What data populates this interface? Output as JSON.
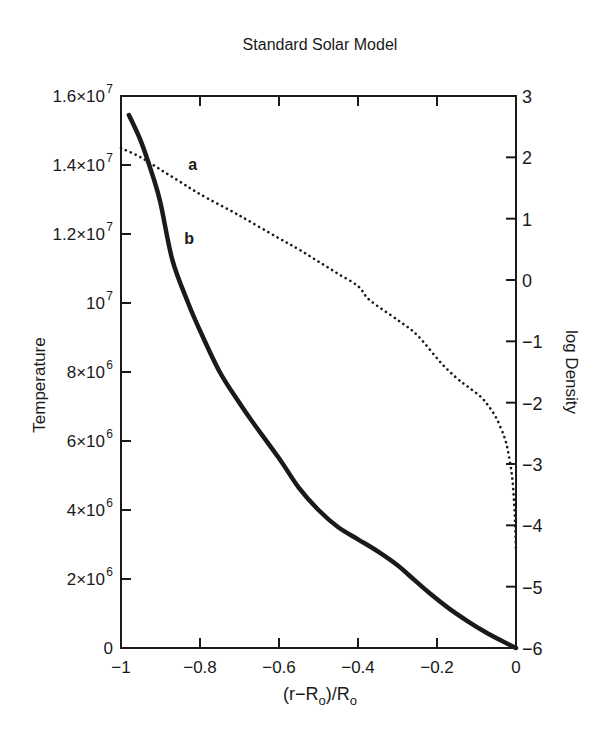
{
  "chart_data": {
    "type": "line",
    "title": "Standard Solar Model",
    "xlabel": "(r−R_o)/R_o",
    "xlabel_parts": {
      "open": "(r−R",
      "sub1": "o",
      "mid": ")/R",
      "sub2": "o"
    },
    "ylabel_left": "Temperature",
    "ylabel_right": "log Density",
    "xlim": [
      -1,
      0
    ],
    "ylim_left": [
      0,
      16000000
    ],
    "ylim_right": [
      -6,
      3
    ],
    "grid": false,
    "legend": "inline labels a and b",
    "x_ticks": [
      {
        "value": -1,
        "label": "−1"
      },
      {
        "value": -0.8,
        "label": "−0.8"
      },
      {
        "value": -0.6,
        "label": "−0.6"
      },
      {
        "value": -0.4,
        "label": "−0.4"
      },
      {
        "value": -0.2,
        "label": "−0.2"
      },
      {
        "value": 0,
        "label": "0"
      }
    ],
    "y_left_ticks": [
      {
        "value": 0,
        "mant": "0",
        "exp": ""
      },
      {
        "value": 2000000,
        "mant": "2×10",
        "exp": "6"
      },
      {
        "value": 4000000,
        "mant": "4×10",
        "exp": "6"
      },
      {
        "value": 6000000,
        "mant": "6×10",
        "exp": "6"
      },
      {
        "value": 8000000,
        "mant": "8×10",
        "exp": "6"
      },
      {
        "value": 10000000,
        "mant": "10",
        "exp": "7"
      },
      {
        "value": 12000000,
        "mant": "1.2×10",
        "exp": "7"
      },
      {
        "value": 14000000,
        "mant": "1.4×10",
        "exp": "7"
      },
      {
        "value": 16000000,
        "mant": "1.6×10",
        "exp": "7"
      }
    ],
    "y_right_ticks": [
      {
        "value": 3,
        "label": "3"
      },
      {
        "value": 2,
        "label": "2"
      },
      {
        "value": 1,
        "label": "1"
      },
      {
        "value": 0,
        "label": "0"
      },
      {
        "value": -1,
        "label": "−1"
      },
      {
        "value": -2,
        "label": "−2"
      },
      {
        "value": -3,
        "label": "−3"
      },
      {
        "value": -4,
        "label": "−4"
      },
      {
        "value": -5,
        "label": "−5"
      },
      {
        "value": -6,
        "label": "−6"
      }
    ],
    "series": [
      {
        "name": "a",
        "label": "a",
        "description": "log Density (right axis)",
        "axis": "right",
        "style": "dotted",
        "label_pos": {
          "x": -0.83,
          "y": 1.8
        },
        "x": [
          -1.0,
          -0.95,
          -0.9,
          -0.85,
          -0.8,
          -0.7,
          -0.6,
          -0.55,
          -0.5,
          -0.45,
          -0.4,
          -0.37,
          -0.3,
          -0.25,
          -0.19,
          -0.15,
          -0.12,
          -0.09,
          -0.07,
          -0.05,
          -0.03,
          -0.02,
          -0.01,
          -0.005,
          -0.002,
          0.0
        ],
        "values": [
          2.15,
          2.0,
          1.8,
          1.6,
          1.4,
          1.05,
          0.68,
          0.5,
          0.3,
          0.1,
          -0.1,
          -0.33,
          -0.65,
          -0.9,
          -1.35,
          -1.6,
          -1.75,
          -1.9,
          -2.05,
          -2.25,
          -2.55,
          -2.8,
          -3.2,
          -3.6,
          -4.0,
          -4.4
        ]
      },
      {
        "name": "b",
        "label": "b",
        "description": "Temperature (left axis)",
        "axis": "left",
        "style": "solid",
        "label_pos": {
          "x": -0.84,
          "y": 11700000
        },
        "x": [
          -0.98,
          -0.95,
          -0.92,
          -0.9,
          -0.87,
          -0.83,
          -0.8,
          -0.75,
          -0.7,
          -0.67,
          -0.6,
          -0.55,
          -0.5,
          -0.45,
          -0.4,
          -0.35,
          -0.3,
          -0.27,
          -0.22,
          -0.17,
          -0.12,
          -0.08,
          -0.04,
          0.0
        ],
        "values": [
          15450000,
          14700000,
          13700000,
          12900000,
          11250000,
          10000000,
          9200000,
          8000000,
          7100000,
          6600000,
          5500000,
          4650000,
          4000000,
          3500000,
          3150000,
          2800000,
          2400000,
          2100000,
          1600000,
          1150000,
          760000,
          480000,
          230000,
          0
        ]
      }
    ]
  }
}
